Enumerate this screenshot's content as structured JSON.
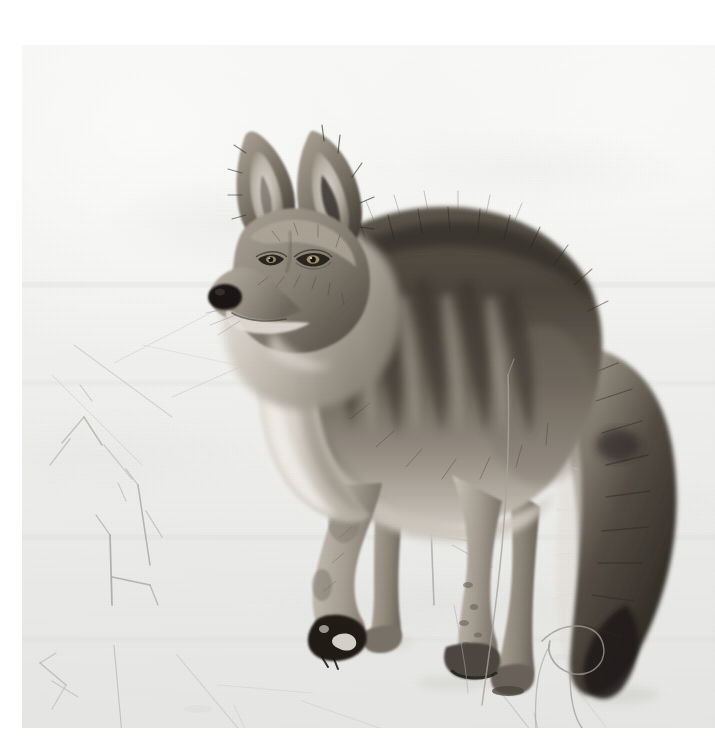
{
  "page": {
    "background_color": "#ffffff",
    "width": 715,
    "height": 755
  },
  "photo": {
    "name": "coyote-in-snow-photograph",
    "subject": "coyote",
    "scene": "snow field",
    "orientation": "landscape-square",
    "frame": {
      "x": 22,
      "y": 45,
      "width": 693,
      "height": 683
    },
    "palette": {
      "snow_highlight": "#fbfbfa",
      "snow_base": "#f1f1ef",
      "snow_shadow": "#e4e4e2",
      "fur_light": "#cfc9c0",
      "fur_mid": "#8d857a",
      "fur_dark": "#4a443d",
      "fur_darkest": "#262320",
      "nose_black": "#1a1817",
      "eye_amber": "#9b8a6b",
      "grass_stem": "#b9b9b6"
    },
    "caption": ""
  },
  "subject": {
    "pose": "standing, body facing right, head turned toward camera-left",
    "parts": [
      {
        "name": "left-ear",
        "label": "Left ear"
      },
      {
        "name": "right-ear",
        "label": "Right ear"
      },
      {
        "name": "muzzle",
        "label": "Muzzle"
      },
      {
        "name": "nose",
        "label": "Nose"
      },
      {
        "name": "left-eye",
        "label": "Left eye"
      },
      {
        "name": "right-eye",
        "label": "Right eye"
      },
      {
        "name": "neck-ruff",
        "label": "Neck ruff"
      },
      {
        "name": "shoulder",
        "label": "Shoulder"
      },
      {
        "name": "back",
        "label": "Back"
      },
      {
        "name": "flank",
        "label": "Flank"
      },
      {
        "name": "front-leg-near",
        "label": "Near front leg"
      },
      {
        "name": "front-leg-far",
        "label": "Far front leg"
      },
      {
        "name": "hind-leg-near",
        "label": "Near hind leg"
      },
      {
        "name": "hind-leg-far",
        "label": "Far hind leg"
      },
      {
        "name": "tail",
        "label": "Bushy tail with dark tip"
      }
    ]
  },
  "foreground": {
    "grass_clusters": [
      {
        "name": "grass-cluster-left-upper"
      },
      {
        "name": "grass-cluster-left-mid"
      },
      {
        "name": "grass-cluster-left-lower"
      },
      {
        "name": "grass-cluster-center"
      },
      {
        "name": "grass-stem-tall-center"
      },
      {
        "name": "grass-stem-loop-right"
      },
      {
        "name": "grass-cluster-bottom-right"
      }
    ]
  }
}
